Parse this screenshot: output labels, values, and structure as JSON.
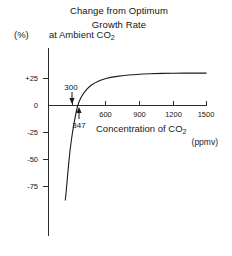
{
  "figure": {
    "title_lines": [
      "Change from Optimum",
      "Growth Rate"
    ],
    "y_axis_unit_label": "(%)",
    "title_line_3": "at Ambient CO",
    "title_line_3_sub": "2",
    "x_axis_label": "Concentration of CO",
    "x_axis_label_sub": "2",
    "x_axis_units": "(ppmv)",
    "annotation_upper": "300",
    "annotation_lower": "347"
  },
  "chart_data": {
    "type": "line",
    "xlabel": "Concentration of CO2 (ppmv)",
    "ylabel": "Change from Optimum Growth Rate (%)",
    "xlim": [
      0,
      1560
    ],
    "ylim": [
      -90,
      40
    ],
    "xticks": [
      300,
      600,
      900,
      1200,
      1500
    ],
    "xtick_labels": [
      "300",
      "600",
      "900",
      "1200",
      "1500"
    ],
    "yticks": [
      25,
      0,
      -25,
      -50,
      -75
    ],
    "ytick_labels": [
      "+25",
      "0",
      "-25",
      "-50",
      "-75"
    ],
    "grid": false,
    "legend": null,
    "annotations": [
      {
        "label": "300",
        "x": 300,
        "y": 0,
        "position": "above-axis",
        "arrow": "down",
        "note": "ambient CO2 reference marker"
      },
      {
        "label": "347",
        "x": 347,
        "y": 0,
        "position": "below-axis",
        "arrow": "up",
        "note": "zero-crossing of curve"
      }
    ],
    "series": [
      {
        "name": "Change from optimum growth rate",
        "x": [
          235,
          245,
          255,
          265,
          280,
          300,
          320,
          347,
          380,
          420,
          470,
          530,
          600,
          700,
          800,
          900,
          1000,
          1100,
          1200,
          1300,
          1400,
          1500
        ],
        "y": [
          -88,
          -78,
          -66,
          -55,
          -40,
          -25,
          -13,
          0,
          8,
          14,
          19,
          22.5,
          25,
          27,
          28.3,
          29,
          29.4,
          29.7,
          29.9,
          30,
          30,
          30
        ]
      }
    ],
    "asymptote_value": 30,
    "zero_crossing_x": 347
  }
}
